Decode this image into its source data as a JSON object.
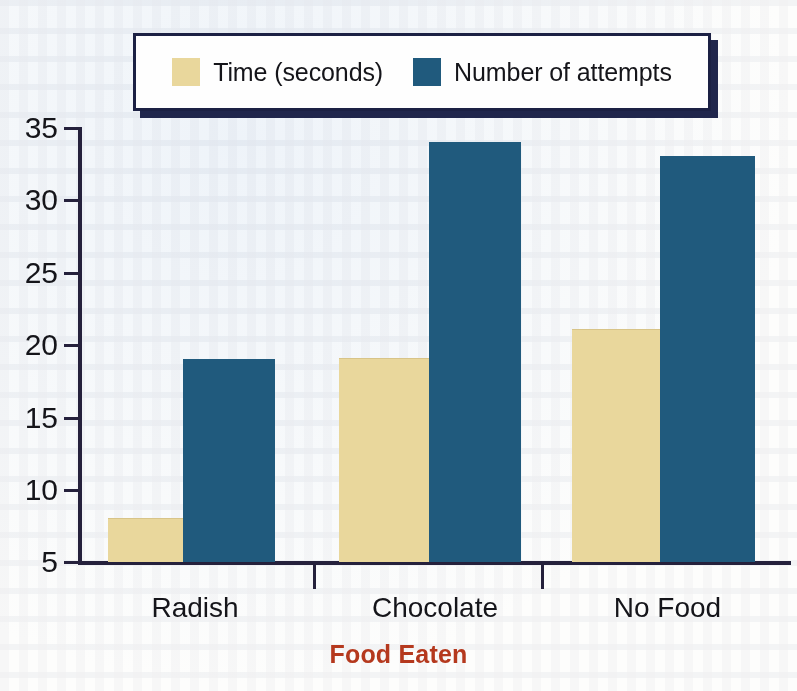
{
  "colors": {
    "series_time": "#e9d79c",
    "series_attempts": "#205a7d",
    "axis": "#25213c",
    "legend_border": "#1c2144",
    "xlabel_text": "#b5391e",
    "background": "#fdfdfc"
  },
  "legend": {
    "position": "top",
    "entries": [
      {
        "label": "Time (seconds)",
        "swatch": "#e9d79c",
        "icon": "legend-swatch-icon"
      },
      {
        "label": "Number of attempts",
        "swatch": "#205a7d",
        "icon": "legend-swatch-icon"
      }
    ]
  },
  "axes": {
    "y_ticks": [
      "35",
      "30",
      "25",
      "20",
      "15",
      "10",
      "5"
    ],
    "x_title": "Food Eaten",
    "y_title": ""
  },
  "chart_data": {
    "type": "bar",
    "title": "",
    "subtitle": "",
    "xlabel": "Food Eaten",
    "ylabel": "",
    "categories": [
      "Radish",
      "Chocolate",
      "No Food"
    ],
    "series": [
      {
        "name": "Time (seconds)",
        "values": [
          8,
          19,
          21
        ],
        "color": "#e9d79c"
      },
      {
        "name": "Number of attempts",
        "values": [
          19,
          34,
          33
        ],
        "color": "#205a7d"
      }
    ],
    "ylim": [
      5,
      35
    ],
    "ytick_step": 5,
    "grid": false,
    "legend_position": "top",
    "bar_grouping": "grouped-adjacent",
    "annotations": []
  }
}
